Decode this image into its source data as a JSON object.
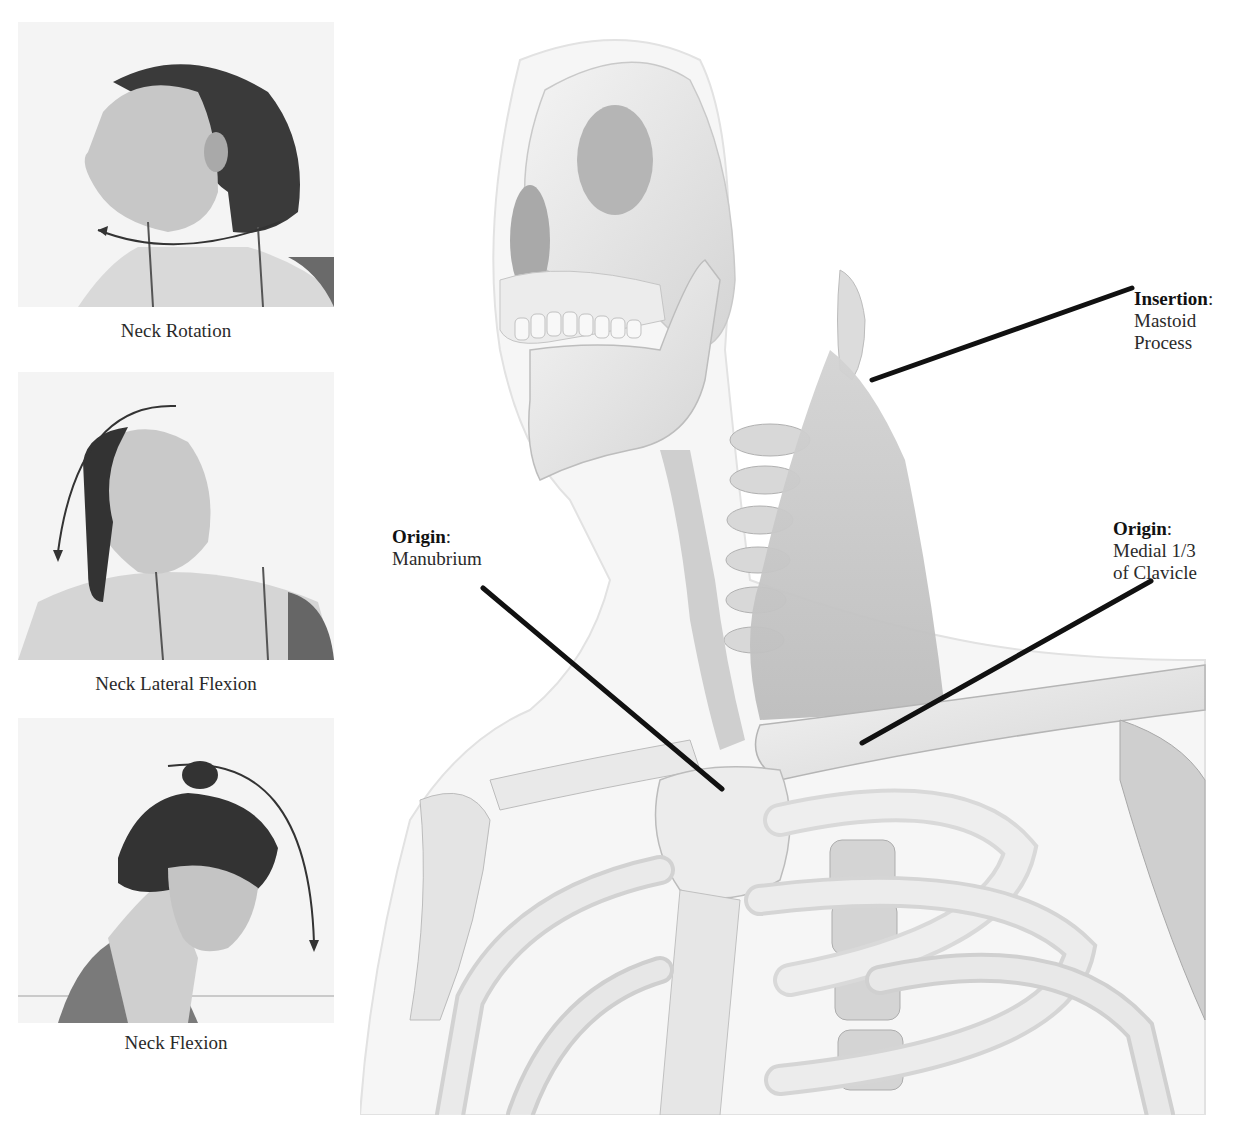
{
  "figure": {
    "photo_panels": [
      {
        "caption": "Neck Rotation",
        "motion": "neck-rotation",
        "arrow": "curved-horizontal-arrow"
      },
      {
        "caption": "Neck Lateral Flexion",
        "motion": "neck-lateral-flexion",
        "arrow": "curved-arc-arrow-down-left"
      },
      {
        "caption": "Neck Flexion",
        "motion": "neck-flexion",
        "arrow": "curved-arc-arrow-down-right"
      }
    ],
    "labels": {
      "insertion": {
        "title": "Insertion",
        "colon": ":",
        "line1": "Mastoid",
        "line2": "Process"
      },
      "origin_manubrium": {
        "title": "Origin",
        "colon": ":",
        "line1": "Manubrium"
      },
      "origin_clavicle": {
        "title": "Origin",
        "colon": ":",
        "line1": "Medial 1/3",
        "line2": "of Clavicle"
      }
    },
    "colors": {
      "leader_line": "#111111",
      "bone": "#ececec",
      "bone_shadow": "#b9b9b9",
      "muscle": "#c9c9c9",
      "skin_outline": "#e2e2e2"
    }
  }
}
